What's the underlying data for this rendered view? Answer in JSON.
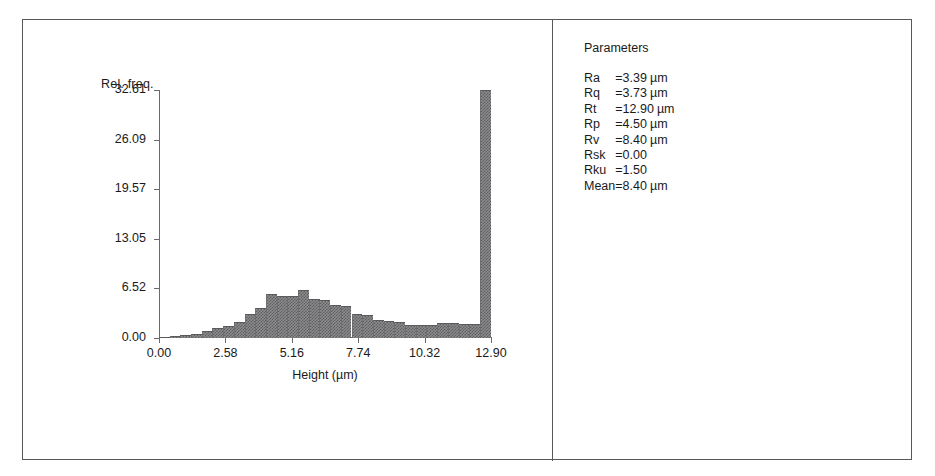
{
  "chart_data": {
    "type": "bar",
    "title": "",
    "subtitle": "",
    "xlabel": "Height (µm)",
    "ylabel": "Rel. freq.",
    "xlim": [
      0.0,
      12.9
    ],
    "ylim": [
      0.0,
      32.61
    ],
    "grid": false,
    "legend": null,
    "xticks": [
      "0.00",
      "2.58",
      "5.16",
      "7.74",
      "10.32",
      "12.90"
    ],
    "xtick_values": [
      0.0,
      2.58,
      5.16,
      7.74,
      10.32,
      12.9
    ],
    "yticks": [
      "0.00",
      "6.52",
      "13.05",
      "19.57",
      "26.09",
      "32.61"
    ],
    "ytick_values": [
      0.0,
      6.52,
      13.05,
      19.57,
      26.09,
      32.61
    ],
    "bin_width": 0.4156,
    "x": [
      0.21,
      0.62,
      1.04,
      1.45,
      1.87,
      2.28,
      2.7,
      3.12,
      3.53,
      3.95,
      4.36,
      4.78,
      5.19,
      5.61,
      6.03,
      6.44,
      6.86,
      7.27,
      7.69,
      8.1,
      8.52,
      8.94,
      9.35,
      9.77,
      10.18,
      10.6,
      11.01,
      11.43,
      11.85,
      12.26,
      12.68
    ],
    "values": [
      0.1,
      0.2,
      0.35,
      0.55,
      0.95,
      1.3,
      1.55,
      2.1,
      3.1,
      3.95,
      5.85,
      5.55,
      5.5,
      6.3,
      5.15,
      5.0,
      4.3,
      4.25,
      3.1,
      3.05,
      2.35,
      2.25,
      2.15,
      1.75,
      1.7,
      1.75,
      1.95,
      1.95,
      1.8,
      1.8,
      32.61
    ],
    "series_name": "Relative frequency"
  },
  "chart": {
    "ylabel": "Rel. freq.",
    "xlabel": "Height (µm)"
  },
  "parameters": {
    "title": "Parameters",
    "rows": [
      {
        "name": "Ra",
        "eq": "=",
        "value": "3.39",
        "unit": "µm"
      },
      {
        "name": "Rq",
        "eq": "=",
        "value": "3.73",
        "unit": "µm"
      },
      {
        "name": "Rt",
        "eq": "=",
        "value": "12.90",
        "unit": "µm"
      },
      {
        "name": "Rp",
        "eq": "=",
        "value": "4.50",
        "unit": "µm"
      },
      {
        "name": "Rv",
        "eq": "=",
        "value": "8.40",
        "unit": "µm"
      },
      {
        "name": "Rsk",
        "eq": "=",
        "value": "0.00",
        "unit": ""
      },
      {
        "name": "Rku",
        "eq": "=",
        "value": "1.50",
        "unit": ""
      },
      {
        "name": "Mean",
        "eq": "=",
        "value": "8.40",
        "unit": "µm"
      }
    ]
  },
  "colors": {
    "frame": "#58585a",
    "axis": "#6a6a6c",
    "bar_fill": "#8d8d8f",
    "bar_pattern": "#5d5d5f",
    "text": "#1a1a1a"
  }
}
